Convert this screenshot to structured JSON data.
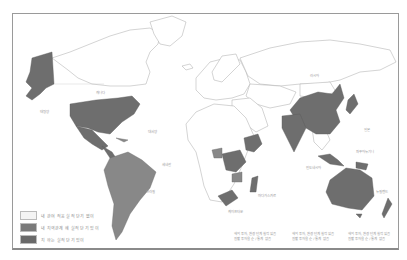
{
  "map": {
    "type": "world-choropleth",
    "colors": {
      "none": "#ffffff",
      "medium": "#8c8c8c",
      "dark": "#6e6e6e",
      "border": "#a0a0a0",
      "frame": "#9a9a9a"
    }
  },
  "legend": {
    "items": [
      {
        "swatch": "#f4f4f4",
        "label": "내 관여 적응 실적 단기 없이"
      },
      {
        "swatch": "#7a7a7a",
        "label": "내 지역관계 혜 실적 단기 있이"
      },
      {
        "swatch": "#6a6a6a",
        "label": "지 하는 실적 단기 있이"
      }
    ]
  },
  "annotations": {
    "south_africa": "케이프타운",
    "indian_ocean_1_line1": "해외 투자, 환경 단계 실적 있음",
    "indian_ocean_1_line2": "원활 투자율 순 / 통계 없음",
    "indian_ocean_2_line1": "해외 투자, 환경 단계 실적 있음",
    "indian_ocean_2_line2": "원활 투자율 순 / 통계 없음",
    "pacific_1_line1": "해외 투자, 환경 단계 실적 있음",
    "pacific_1_line2": "원활 투자율 순 / 통계 없음",
    "canada": "캐나다",
    "pacific_west": "태평양",
    "atlantic": "대서양",
    "africa_west": "세네갈",
    "madagascar": "마다가스카르",
    "brazil": "브라질",
    "russia": "러시아",
    "japan_sea": "일본",
    "indonesia": "인도네시아",
    "png": "파푸아뉴기니",
    "nz": "뉴질랜드"
  }
}
